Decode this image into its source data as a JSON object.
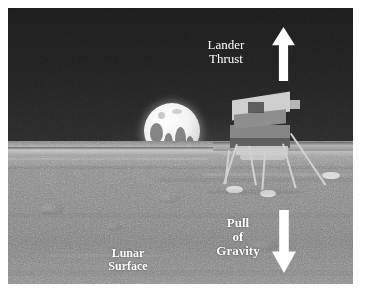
{
  "figure": {
    "kind": "annotated-photograph",
    "background_color": "#ffffff",
    "photo": {
      "sky_color": "#202020",
      "ground_color": "#888888",
      "earth_color": "#f2f2f2"
    }
  },
  "annotations": {
    "thrust": {
      "label": "Lander\nThrust",
      "arrow": "up-arrow-icon",
      "arrow_color": "#ffffff",
      "text_color": "#ffffff"
    },
    "gravity": {
      "label": "Pull\nof\nGravity",
      "arrow": "down-arrow-icon",
      "arrow_color": "#ffffff",
      "text_color": "#ffffff"
    },
    "surface": {
      "label": "Lunar\nSurface",
      "text_color": "#ffffff"
    }
  },
  "objects": {
    "earth": "earth-rise",
    "lander": "lunar-module"
  }
}
